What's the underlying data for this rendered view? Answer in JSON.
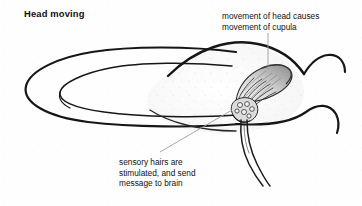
{
  "diagram": {
    "title": "Head moving",
    "labels": {
      "cupula": "movement of head causes\nmovement of cupula",
      "sensory_hairs": "sensory hairs are\nstimulated, and send\nmessage to brain"
    },
    "parts": {
      "canal_name": "semicircular-canal",
      "loop_name": "canal-u-turn-loop",
      "ampulla_name": "ampulla",
      "cupula_name": "cupula",
      "hair_cells_name": "hair-cell-cluster",
      "hair_bundles_name": "sensory-hair-bundles",
      "nerve_name": "nerve-fibres"
    },
    "colors": {
      "ink": "#111111",
      "outline": "#1a1a1a",
      "leader": "#9a9a9a",
      "cupula_light": "#e3e3e3",
      "cupula_dark": "#8d8d8d",
      "fill": "#fdfdfd",
      "background": "#ffffff"
    },
    "leader_lines": {
      "cupula_leader": "vertical-line-from-label-to-cupula",
      "hairs_leader": "diagonal-line-from-caption-to-hair-cells"
    }
  }
}
